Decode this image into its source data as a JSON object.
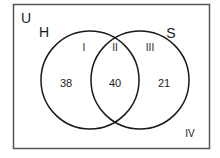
{
  "diagram": {
    "type": "venn",
    "universe_label": "U",
    "sets": [
      {
        "label": "H",
        "center": [
          90,
          80
        ],
        "radius": 49
      },
      {
        "label": "S",
        "center": [
          140,
          80
        ],
        "radius": 49
      }
    ],
    "regions": [
      {
        "roman": "I",
        "description": "H only",
        "count": "38"
      },
      {
        "roman": "II",
        "description": "H and S",
        "count": "40"
      },
      {
        "roman": "III",
        "description": "S only",
        "count": "21"
      },
      {
        "roman": "IV",
        "description": "neither",
        "count": null
      }
    ],
    "colors": {
      "stroke": "#1a1a1a",
      "border": "#555555",
      "background": "#ffffff"
    }
  }
}
